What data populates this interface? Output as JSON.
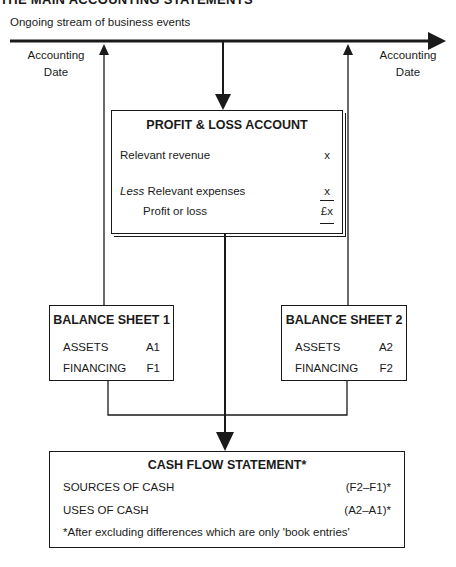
{
  "title": "THE MAIN ACCOUNTING STATEMENTS",
  "timeline": {
    "label": "Ongoing stream of business events",
    "left_date_line1": "Accounting",
    "left_date_line2": "Date",
    "right_date_line1": "Accounting",
    "right_date_line2": "Date"
  },
  "profit_loss": {
    "title": "PROFIT & LOSS ACCOUNT",
    "revenue_label": "Relevant revenue",
    "revenue_value": "x",
    "less_prefix": "Less",
    "expenses_label": " Relevant expenses",
    "expenses_value": "x",
    "result_label": "Profit or loss",
    "result_value": "£x"
  },
  "balance_sheet_1": {
    "title": "BALANCE SHEET 1",
    "rows": [
      {
        "label": "ASSETS",
        "value": "A1"
      },
      {
        "label": "FINANCING",
        "value": "F1"
      }
    ]
  },
  "balance_sheet_2": {
    "title": "BALANCE SHEET 2",
    "rows": [
      {
        "label": "ASSETS",
        "value": "A2"
      },
      {
        "label": "FINANCING",
        "value": "F2"
      }
    ]
  },
  "cash_flow": {
    "title": "CASH FLOW STATEMENT*",
    "rows": [
      {
        "label": "SOURCES OF CASH",
        "value": "(F2–F1)*"
      },
      {
        "label": "USES OF CASH",
        "value": "(A2–A1)*"
      }
    ],
    "footnote": "*After excluding differences which are only 'book entries'"
  }
}
